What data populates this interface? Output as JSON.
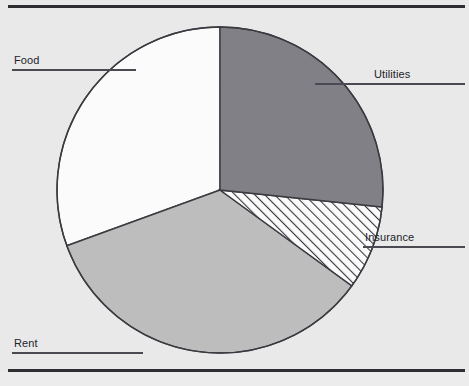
{
  "chart_data": {
    "type": "pie",
    "title": "",
    "labels": [
      "Utilities",
      "Insurance",
      "Rent",
      "Food"
    ],
    "values": [
      26.7,
      8.3,
      34.4,
      30.6
    ],
    "units": "percent",
    "start_angle_deg": 0,
    "direction": "clockwise",
    "slice_angles_deg": [
      96,
      30,
      124,
      110
    ],
    "legend": "none",
    "grid": false,
    "annotations": [
      "Each slice is labelled by a leader line drawn to text outside the pie"
    ],
    "slices": [
      {
        "label": "Utilities",
        "value": 26.7,
        "angle_deg": 96,
        "start_deg": 0,
        "end_deg": 96,
        "fill": "#808086",
        "fill_style": "solid",
        "stroke": "#3a3a40"
      },
      {
        "label": "Insurance",
        "value": 8.3,
        "angle_deg": 30,
        "start_deg": 96,
        "end_deg": 126,
        "fill": "#fbfbfb",
        "fill_style": "diagonal-hatch",
        "hatch_color": "#3a3a40",
        "stroke": "#3a3a40"
      },
      {
        "label": "Rent",
        "value": 34.4,
        "angle_deg": 124,
        "start_deg": 126,
        "end_deg": 250,
        "fill": "#bdbdbd",
        "fill_style": "solid",
        "stroke": "#3a3a40"
      },
      {
        "label": "Food",
        "value": 30.6,
        "angle_deg": 110,
        "start_deg": 250,
        "end_deg": 360,
        "fill": "#fbfbfb",
        "fill_style": "solid",
        "stroke": "#3a3a40"
      }
    ]
  },
  "labels": {
    "food": "Food",
    "utilities": "Utilities",
    "insurance": "Insurance",
    "rent": "Rent"
  },
  "colors": {
    "background": "#e9e9e9",
    "rule": "#2e2e33",
    "outline": "#3a3a40",
    "text": "#23232a",
    "leader": "#4a4a52",
    "utilities_fill": "#808086",
    "rent_fill": "#bdbdbd",
    "food_fill": "#fbfbfb",
    "insurance_fill": "#fbfbfb"
  }
}
